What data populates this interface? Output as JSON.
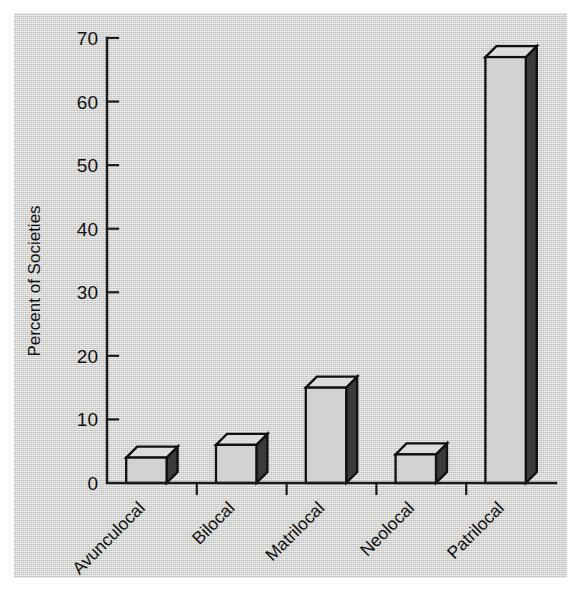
{
  "chart_data": {
    "type": "bar",
    "title": "",
    "subtitle": "",
    "xlabel": "",
    "ylabel": "Percent of Societies",
    "categories": [
      "Avunculocal",
      "Bilocal",
      "Matrilocal",
      "Neolocal",
      "Patrilocal"
    ],
    "values": [
      4,
      6,
      15,
      4.5,
      67
    ],
    "ylim": [
      0,
      70
    ],
    "ytick_labels": [
      "0",
      "10",
      "20",
      "30",
      "40",
      "50",
      "60",
      "70"
    ],
    "ytick_values": [
      0,
      10,
      20,
      30,
      40,
      50,
      60,
      70
    ],
    "grid": false,
    "legend": false,
    "style": "3d-bar",
    "colors": {
      "bar_front": "#d2d2d0",
      "bar_top": "#dcdcda",
      "bar_side": "#3b3b3b",
      "outline": "#101010",
      "background": "#d6d6d4",
      "text": "#111111"
    },
    "x_tick_label_rotation_deg": 45
  },
  "figure": {
    "panel_name": "bar-chart-panel"
  }
}
